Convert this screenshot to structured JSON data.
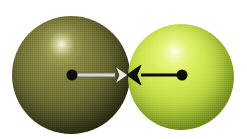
{
  "figure": {
    "canvas": {
      "width": 247,
      "height": 139,
      "background": "#ffffff"
    }
  },
  "atoms": [
    {
      "id": "left-atom",
      "label": "left-sphere",
      "center": {
        "x": 72,
        "y": 75
      },
      "sphere_center": {
        "x": 71,
        "y": 75
      },
      "radius": 59,
      "diameter": 119,
      "base_color": "#6b6b33",
      "highlight_color": "#fffff0",
      "shadow_color": "#24240f",
      "highlight_position": {
        "x": 62,
        "y": 45
      },
      "nucleus_dot": {
        "name": "left-nucleus-dot",
        "x": 72,
        "y": 75,
        "radius": 5,
        "color": "#0d0d0d"
      }
    },
    {
      "id": "right-atom",
      "label": "right-sphere",
      "center": {
        "x": 182,
        "y": 75
      },
      "sphere_center": {
        "x": 181,
        "y": 77
      },
      "radius": 53,
      "diameter": 106,
      "base_color": "#c2da46",
      "highlight_color": "#ffffff",
      "shadow_color": "#64821d",
      "highlight_position": {
        "x": 172,
        "y": 50
      },
      "nucleus_dot": {
        "name": "right-nucleus-dot",
        "x": 182,
        "y": 75,
        "radius": 5,
        "color": "#0d0d0d"
      }
    }
  ],
  "vectors": [
    {
      "id": "left-radius-vector",
      "name": "left-radius-arrow",
      "from": {
        "x": 72,
        "y": 75
      },
      "to": {
        "x": 128,
        "y": 75
      },
      "shaft_color": "#d8d8d0",
      "shaft_outline_color": "#6e6e58",
      "arrowhead_color": "#e8e8e2",
      "arrowhead_outline_color": "#3a3a2c",
      "direction": "right",
      "shaft_width": 3,
      "arrowhead_length": 13,
      "arrowhead_half_height": 9
    },
    {
      "id": "right-radius-vector",
      "name": "right-radius-arrow",
      "from": {
        "x": 182,
        "y": 75
      },
      "to": {
        "x": 127,
        "y": 75
      },
      "shaft_color": "#0d0d0d",
      "shaft_outline_color": "#0d0d0d",
      "arrowhead_color": "#0d0d0d",
      "arrowhead_outline_color": "#0d0d0d",
      "direction": "left",
      "shaft_width": 3,
      "arrowhead_length": 14,
      "arrowhead_half_height": 10
    }
  ],
  "contact_point": {
    "name": "sphere-contact-point",
    "x": 128,
    "y": 75
  }
}
